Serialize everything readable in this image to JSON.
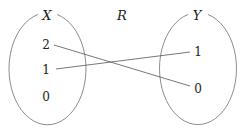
{
  "diagram": {
    "relation_label": "R",
    "sets": [
      {
        "name": "X",
        "elements": [
          "2",
          "1",
          "0"
        ]
      },
      {
        "name": "Y",
        "elements": [
          "1",
          "0"
        ]
      }
    ],
    "mappings": [
      {
        "from": "2",
        "to": "0"
      },
      {
        "from": "1",
        "to": "1"
      }
    ],
    "colors": {
      "stroke": "#6e6e6e",
      "text": "#222222"
    }
  }
}
